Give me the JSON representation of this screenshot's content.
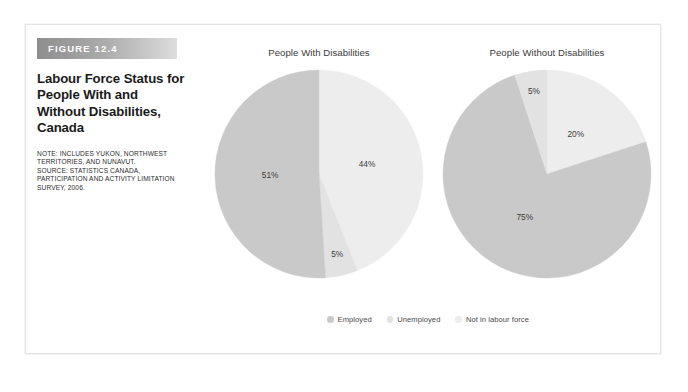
{
  "figure": {
    "tag": "FIGURE 12.4",
    "title": "Labour Force Status for People With and Without Disabilities, Canada",
    "note_lines": [
      "NOTE: INCLUDES YUKON, NORTHWEST",
      "TERRITORIES, AND NUNAVUT.",
      "SOURCE: STATISTICS CANADA,",
      "PARTICIPATION AND ACTIVITY LIMITATION",
      "SURVEY, 2006."
    ]
  },
  "colors": {
    "employed": "#c9c9c9",
    "unemployed": "#e2e2e2",
    "not_in_labour_force": "#ededed",
    "tag_bar_dark": "#8e8e8e",
    "tag_bar_light": "#dedede",
    "text": "#3a3a3a",
    "frame": "#e3e3e3",
    "background": "#ffffff"
  },
  "legend": {
    "items": [
      {
        "label": "Employed",
        "color": "#c9c9c9"
      },
      {
        "label": "Unemployed",
        "color": "#e2e2e2"
      },
      {
        "label": "Not in labour force",
        "color": "#ededed"
      }
    ]
  },
  "chart_data": [
    {
      "type": "pie",
      "title": "People With Disabilities",
      "categories": [
        "Not in labour force",
        "Unemployed",
        "Employed"
      ],
      "values": [
        44,
        5,
        51
      ],
      "labels": [
        "44%",
        "5%",
        "51%"
      ],
      "colors": [
        "#ededed",
        "#e2e2e2",
        "#c9c9c9"
      ],
      "start_angle_deg": 0,
      "direction": "clockwise",
      "legend_position": "bottom-center",
      "units": "percent"
    },
    {
      "type": "pie",
      "title": "People Without Disabilities",
      "categories": [
        "Not in labour force",
        "Employed",
        "Unemployed"
      ],
      "values": [
        20,
        75,
        5
      ],
      "labels": [
        "20%",
        "75%",
        "5%"
      ],
      "colors": [
        "#ededed",
        "#c9c9c9",
        "#e2e2e2"
      ],
      "start_angle_deg": 0,
      "direction": "clockwise",
      "legend_position": "bottom-center",
      "units": "percent"
    }
  ]
}
